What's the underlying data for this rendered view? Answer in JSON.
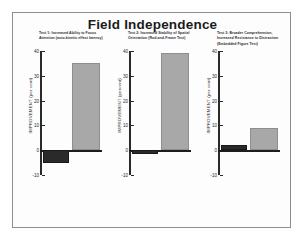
{
  "figure": {
    "title": "Field Independence",
    "page_border_color": "#8a8d94"
  },
  "chart_data": [
    {
      "type": "bar",
      "title": "Test 1: Increased Ability to Focus Attention (auto-kinetic effect latency)",
      "xlabel": "",
      "ylabel": "IMPROVEMENT (per cent)",
      "ylim": [
        -10,
        40
      ],
      "yticks": [
        40,
        30,
        20,
        10,
        0,
        -10
      ],
      "ytick_labels": [
        "40",
        "30",
        "20",
        "10",
        "0",
        "-10"
      ],
      "grid": false,
      "legend": "none",
      "categories": [
        "Controls",
        "Meditators"
      ],
      "series": [
        {
          "name": "Control",
          "color": "#2a2a2a",
          "values": [
            -5,
            null
          ]
        },
        {
          "name": "Experimental",
          "color": "#a8a8a8",
          "values": [
            null,
            35
          ]
        }
      ],
      "values": [
        -5,
        35
      ]
    },
    {
      "type": "bar",
      "title": "Test 2: Increased Stability of Spatial Orientation (Rod-and-Frame Test)",
      "xlabel": "",
      "ylabel": "IMPROVEMENT (percent)",
      "ylim": [
        -10,
        40
      ],
      "yticks": [
        40,
        30,
        20,
        10,
        0,
        -10
      ],
      "ytick_labels": [
        "40",
        "30",
        "20",
        "10",
        "0",
        "-10"
      ],
      "grid": false,
      "legend": "none",
      "categories": [
        "Controls",
        "Meditators"
      ],
      "series": [
        {
          "name": "Control",
          "color": "#2a2a2a",
          "values": [
            -1.5,
            null
          ]
        },
        {
          "name": "Experimental",
          "color": "#a8a8a8",
          "values": [
            null,
            39
          ]
        }
      ],
      "values": [
        -1.5,
        39
      ]
    },
    {
      "type": "bar",
      "title": "Test 3: Broader Comprehension, Increased Resistance to Distraction (Embedded Figure Test)",
      "xlabel": "",
      "ylabel": "IMPROVEMENT (per cent)",
      "ylim": [
        -10,
        40
      ],
      "yticks": [
        40,
        30,
        20,
        10,
        0,
        -10
      ],
      "ytick_labels": [
        "40",
        "30",
        "20",
        "10",
        "0",
        "-10"
      ],
      "grid": false,
      "legend": "none",
      "categories": [
        "Controls",
        "Meditators"
      ],
      "series": [
        {
          "name": "Control",
          "color": "#2a2a2a",
          "values": [
            2,
            null
          ]
        },
        {
          "name": "Experimental",
          "color": "#a8a8a8",
          "values": [
            null,
            9
          ]
        }
      ],
      "values": [
        2,
        9
      ]
    }
  ]
}
